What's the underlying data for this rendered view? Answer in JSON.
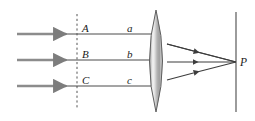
{
  "figure": {
    "type": "optics-ray-diagram",
    "background_color": "#ffffff",
    "line_color": "#3d3d3d",
    "incident_ray_color": "#8c8c8c",
    "refracted_ray_color": "#4a4a4a",
    "lens_fill_light": "#f2f2f2",
    "lens_fill_dark": "#9a9a9a",
    "lens_outline_color": "#5a5a5a",
    "dashed_line_color": "#555555",
    "screen_line_color": "#4a4a4a"
  },
  "labels": {
    "wavefront_points": [
      {
        "id": "A",
        "text": "A",
        "x": 82,
        "y": 32
      },
      {
        "id": "B",
        "text": "B",
        "x": 82,
        "y": 58
      },
      {
        "id": "C",
        "text": "C",
        "x": 82,
        "y": 84
      }
    ],
    "ray_segments": [
      {
        "id": "a",
        "text": "a",
        "x": 127,
        "y": 32
      },
      {
        "id": "b",
        "text": "b",
        "x": 127,
        "y": 58
      },
      {
        "id": "c",
        "text": "c",
        "x": 127,
        "y": 84
      }
    ],
    "focus_point": {
      "id": "P",
      "text": "P",
      "x": 240,
      "y": 66
    }
  },
  "geometry": {
    "incident_rays": [
      {
        "id": "ray-A",
        "x1": 17,
        "y1": 34,
        "x2": 66,
        "y2": 34
      },
      {
        "id": "ray-B",
        "x1": 17,
        "y1": 60,
        "x2": 66,
        "y2": 60
      },
      {
        "id": "ray-C",
        "x1": 17,
        "y1": 86,
        "x2": 66,
        "y2": 86
      }
    ],
    "mid_rays": [
      {
        "id": "ray-a",
        "x1": 66,
        "y1": 34,
        "x2": 150,
        "y2": 34
      },
      {
        "id": "ray-b",
        "x1": 66,
        "y1": 60,
        "x2": 150,
        "y2": 60
      },
      {
        "id": "ray-c",
        "x1": 66,
        "y1": 86,
        "x2": 150,
        "y2": 86
      }
    ],
    "refracted_rays": [
      {
        "id": "refracted-a",
        "x1": 168,
        "y1": 44,
        "x2": 236,
        "y2": 62
      },
      {
        "id": "refracted-b",
        "x1": 168,
        "y1": 62,
        "x2": 236,
        "y2": 62
      },
      {
        "id": "refracted-c",
        "x1": 168,
        "y1": 80,
        "x2": 236,
        "y2": 62
      }
    ],
    "dashed_wavefront": {
      "x": 77,
      "y1": 14,
      "y2": 110
    },
    "screen": {
      "x": 236,
      "y1": 12,
      "y2": 112
    },
    "lens": {
      "cx": 156,
      "cy": 61,
      "half_width": 13,
      "half_height": 51
    },
    "focus": {
      "x": 236,
      "y": 62
    }
  }
}
